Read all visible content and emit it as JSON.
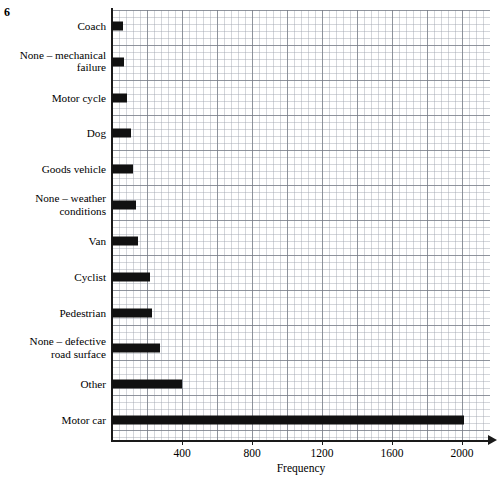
{
  "question_number": "6",
  "chart_data": {
    "type": "bar",
    "orientation": "horizontal",
    "title": "",
    "xlabel": "Frequency",
    "ylabel": "",
    "xlim": [
      0,
      2160
    ],
    "xticks": [
      400,
      800,
      1200,
      1600,
      2000
    ],
    "xtick_labels": [
      "400",
      "800",
      "1200",
      "1600",
      "2000"
    ],
    "grid": true,
    "grid_minor_step": 40,
    "grid_major_step": 200,
    "legend": "none",
    "bar_color": "#111111",
    "categories": [
      "Coach",
      "None – mechanical\nfailure",
      "Motor cycle",
      "Dog",
      "Goods vehicle",
      "None – weather\nconditions",
      "Van",
      "Cyclist",
      "Pedestrian",
      "None – defective\nroad surface",
      "Other",
      "Motor car"
    ],
    "values": [
      60,
      70,
      85,
      110,
      120,
      135,
      150,
      215,
      230,
      275,
      400,
      2010
    ],
    "bars": [
      {
        "label": "Coach",
        "value": 60,
        "lines": 1
      },
      {
        "label": "None – mechanical\nfailure",
        "value": 70,
        "lines": 2
      },
      {
        "label": "Motor cycle",
        "value": 85,
        "lines": 1
      },
      {
        "label": "Dog",
        "value": 110,
        "lines": 1
      },
      {
        "label": "Goods vehicle",
        "value": 120,
        "lines": 1
      },
      {
        "label": "None – weather\nconditions",
        "value": 135,
        "lines": 2
      },
      {
        "label": "Van",
        "value": 150,
        "lines": 1
      },
      {
        "label": "Cyclist",
        "value": 215,
        "lines": 1
      },
      {
        "label": "Pedestrian",
        "value": 230,
        "lines": 1
      },
      {
        "label": "None – defective\nroad surface",
        "value": 275,
        "lines": 2
      },
      {
        "label": "Other",
        "value": 400,
        "lines": 1
      },
      {
        "label": "Motor car",
        "value": 2010,
        "lines": 1
      }
    ]
  }
}
